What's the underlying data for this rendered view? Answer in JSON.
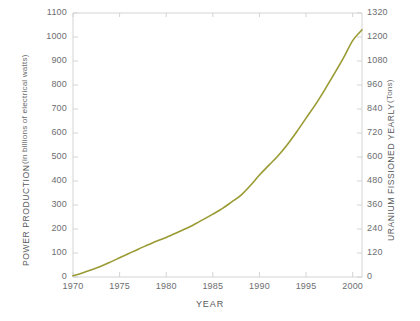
{
  "chart_data": {
    "type": "line",
    "title": "",
    "xlabel": "YEAR",
    "ylabel": "POWER PRODUCTION",
    "ylabel_sub": "(in billions of electrical watts)",
    "y2label": "URANIUM FISSIONED YEARLY",
    "y2label_sub": "(Tons)",
    "xlim": [
      1970,
      2001
    ],
    "ylim": [
      0,
      1100
    ],
    "y2lim": [
      0,
      1320
    ],
    "grid": false,
    "legend": "none",
    "line_color": "#9a9a33",
    "axis_color": "#d3d4d5",
    "text_color": "#6d6e71",
    "xticks": [
      1970,
      1975,
      1980,
      1985,
      1990,
      1995,
      2000
    ],
    "xtick_labels": [
      "1970",
      "1975",
      "1980",
      "1985",
      "1990",
      "1995",
      "2000"
    ],
    "yticks": [
      0,
      100,
      200,
      300,
      400,
      500,
      600,
      700,
      800,
      900,
      1000,
      1100
    ],
    "ytick_labels": [
      "0",
      "100",
      "200",
      "300",
      "400",
      "500",
      "600",
      "700",
      "800",
      "900",
      "1000",
      "1100"
    ],
    "y2ticks": [
      0,
      120,
      240,
      360,
      480,
      600,
      720,
      840,
      960,
      1080,
      1200,
      1320
    ],
    "y2tick_labels": [
      "0",
      "120",
      "240",
      "360",
      "480",
      "600",
      "720",
      "840",
      "960",
      "1080",
      "1200",
      "1320"
    ],
    "series": [
      {
        "name": "Power production",
        "x": [
          1970,
          1971,
          1972,
          1973,
          1974,
          1975,
          1976,
          1977,
          1978,
          1979,
          1980,
          1981,
          1982,
          1983,
          1984,
          1985,
          1986,
          1987,
          1988,
          1989,
          1990,
          1991,
          1992,
          1993,
          1994,
          1995,
          1996,
          1997,
          1998,
          1999,
          2000,
          2001
        ],
        "values": [
          5,
          17,
          30,
          45,
          62,
          80,
          98,
          116,
          133,
          150,
          165,
          182,
          200,
          219,
          240,
          262,
          285,
          312,
          340,
          380,
          425,
          465,
          505,
          552,
          605,
          662,
          718,
          780,
          845,
          912,
          985,
          1030
        ]
      }
    ]
  },
  "axes": {
    "left": {
      "title": "POWER PRODUCTION",
      "subtitle": "(in billions of electrical watts)"
    },
    "right": {
      "title": "URANIUM FISSIONED YEARLY",
      "subtitle": "(Tons)"
    },
    "bottom": {
      "title": "YEAR"
    }
  }
}
